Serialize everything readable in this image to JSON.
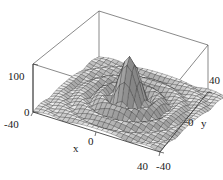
{
  "figure": {
    "kind": "surface-plot-3d",
    "background_color": "#ffffff",
    "line_color": "#333333",
    "mesh_stroke_color": "#2b2b2b"
  },
  "axes": {
    "x": {
      "label": "x",
      "ticks": [
        "-40",
        "0",
        "40"
      ],
      "tick_values": [
        -40,
        0,
        40
      ],
      "range": [
        -40,
        40
      ]
    },
    "y": {
      "label": "y",
      "ticks": [
        "-40",
        "0",
        "40"
      ],
      "tick_values": [
        -40,
        0,
        40
      ],
      "range": [
        -40,
        40
      ]
    },
    "z": {
      "label": "",
      "ticks": [
        "0",
        "100"
      ],
      "tick_values": [
        0,
        100
      ],
      "range": [
        0,
        100
      ]
    }
  },
  "chart_data": {
    "type": "surface",
    "title": "",
    "xlabel": "x",
    "ylabel": "y",
    "zlabel": "",
    "xlim": [
      -40,
      40
    ],
    "ylim": [
      -40,
      40
    ],
    "zlim": [
      0,
      100
    ],
    "grid": true,
    "legend": false,
    "colormap": "grayscale",
    "mesh_n": 26,
    "surface_description": "Radially damped oscillatory peak: a tall central maximum near the origin surrounded by concentric ring-shaped ripples that decay toward the plot edges.",
    "function_note": "z approx 100 * |sin(r)/r| style damped radial wave, r = sqrt(x^2+y^2)",
    "peaks": [
      {
        "x": 0,
        "y": 0,
        "z": 100
      },
      {
        "x": -10,
        "y": 10,
        "z": 46
      },
      {
        "x": 12,
        "y": -9,
        "z": 44
      },
      {
        "x": 14,
        "y": 14,
        "z": 38
      }
    ],
    "viewpoint": {
      "azimuth_deg": -52,
      "elevation_deg": 28
    }
  },
  "tick_labels": {
    "z_top": "100",
    "z_bottom": "0",
    "x_start": "-40",
    "x_mid": "0",
    "x_end": "40",
    "y_start": "-40",
    "y_mid": "0",
    "y_end": "40"
  },
  "axis_names": {
    "x": "x",
    "y": "y"
  }
}
